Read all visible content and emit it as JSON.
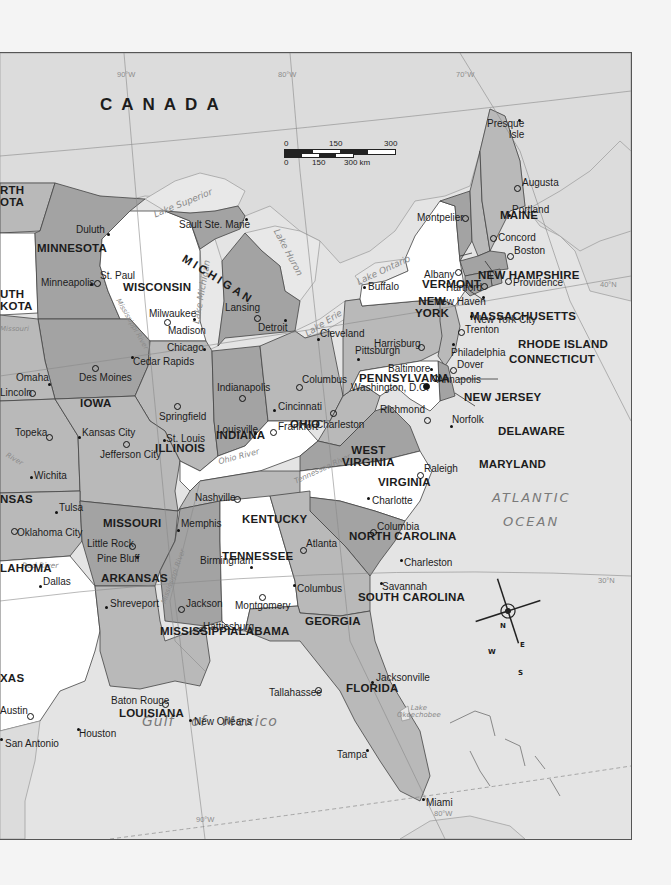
{
  "map": {
    "country_label": "CANADA",
    "oceans": {
      "atlantic_line1": "ATLANTIC",
      "atlantic_line2": "OCEAN",
      "gulf": "Gulf   of   Mexico"
    },
    "gridlines": {
      "w90_top": "90°W",
      "w80_top": "80°W",
      "w70_top": "70°W",
      "n40": "40°N",
      "n30": "30°N",
      "w90_bottom": "90°W",
      "w80_bottom": "80°W"
    },
    "scale_bar": {
      "mi_0": "0",
      "mi_150": "150",
      "mi_300": "300 mi",
      "km_0": "0",
      "km_150": "150",
      "km_300": "300 km"
    },
    "compass": {
      "n": "N",
      "s": "S",
      "e": "E",
      "w": "W"
    },
    "colors": {
      "dark_state": "#a3a3a3",
      "mid_state": "#b9b9b9",
      "light_state": "#ffffff",
      "foreign_land": "#dcdcdc",
      "water": "#e6e6e6",
      "border": "#3a3a3a"
    },
    "states": [
      {
        "id": "north-dakota",
        "label": "RTH\nOTA"
      },
      {
        "id": "minnesota",
        "label": "MINNESOTA"
      },
      {
        "id": "south-dakota",
        "label": "UTH\nKOTA"
      },
      {
        "id": "wisconsin",
        "label": "WISCONSIN"
      },
      {
        "id": "michigan",
        "label": "MICHIGAN"
      },
      {
        "id": "iowa",
        "label": "IOWA"
      },
      {
        "id": "illinois",
        "label": "ILLINOIS"
      },
      {
        "id": "indiana",
        "label": "INDIANA"
      },
      {
        "id": "ohio",
        "label": "OHIO"
      },
      {
        "id": "kansas",
        "label": "NSAS"
      },
      {
        "id": "missouri",
        "label": "MISSOURI"
      },
      {
        "id": "kentucky",
        "label": "KENTUCKY"
      },
      {
        "id": "west-virginia",
        "label": "WEST\nVIRGINIA"
      },
      {
        "id": "virginia",
        "label": "VIRGINIA"
      },
      {
        "id": "pennsylvania",
        "label": "PENNSYLVANIA"
      },
      {
        "id": "new-york",
        "label": "NEW\nYORK"
      },
      {
        "id": "vermont",
        "label": "VERMONT"
      },
      {
        "id": "new-hampshire",
        "label": "NEW HAMPSHIRE"
      },
      {
        "id": "maine",
        "label": "MAINE"
      },
      {
        "id": "massachusetts",
        "label": "MASSACHUSETTS"
      },
      {
        "id": "rhode-island",
        "label": "RHODE ISLAND"
      },
      {
        "id": "connecticut",
        "label": "CONNECTICUT"
      },
      {
        "id": "new-jersey",
        "label": "NEW JERSEY"
      },
      {
        "id": "delaware",
        "label": "DELAWARE"
      },
      {
        "id": "maryland",
        "label": "MARYLAND"
      },
      {
        "id": "oklahoma",
        "label": "LAHOMA"
      },
      {
        "id": "arkansas",
        "label": "ARKANSAS"
      },
      {
        "id": "tennessee",
        "label": "TENNESSEE"
      },
      {
        "id": "north-carolina",
        "label": "NORTH CAROLINA"
      },
      {
        "id": "south-carolina",
        "label": "SOUTH CAROLINA"
      },
      {
        "id": "mississippi",
        "label": "MISSISSIPPI"
      },
      {
        "id": "alabama",
        "label": "ALABAMA"
      },
      {
        "id": "georgia",
        "label": "GEORGIA"
      },
      {
        "id": "texas",
        "label": "XAS"
      },
      {
        "id": "louisiana",
        "label": "LOUISIANA"
      },
      {
        "id": "florida",
        "label": "FLORIDA"
      }
    ],
    "cities": [
      {
        "name": "Presque\nIsle"
      },
      {
        "name": "Augusta"
      },
      {
        "name": "Portland"
      },
      {
        "name": "Concord"
      },
      {
        "name": "Montpelier"
      },
      {
        "name": "Boston"
      },
      {
        "name": "Albany"
      },
      {
        "name": "Providence"
      },
      {
        "name": "Hartford"
      },
      {
        "name": "Buffalo"
      },
      {
        "name": "New Haven"
      },
      {
        "name": "New York City"
      },
      {
        "name": "Trenton"
      },
      {
        "name": "Harrisburg"
      },
      {
        "name": "Philadelphia"
      },
      {
        "name": "Pittsburgh"
      },
      {
        "name": "Dover"
      },
      {
        "name": "Baltimore"
      },
      {
        "name": "Annapolis"
      },
      {
        "name": "Washington, D.C."
      },
      {
        "name": "Richmond"
      },
      {
        "name": "Norfolk"
      },
      {
        "name": "Charleston"
      },
      {
        "name": "Cleveland"
      },
      {
        "name": "Columbus"
      },
      {
        "name": "Cincinnati"
      },
      {
        "name": "Frankfort"
      },
      {
        "name": "Louisville"
      },
      {
        "name": "Indianapolis"
      },
      {
        "name": "Springfield"
      },
      {
        "name": "St. Louis"
      },
      {
        "name": "Chicago"
      },
      {
        "name": "Detroit"
      },
      {
        "name": "Lansing"
      },
      {
        "name": "Milwaukee"
      },
      {
        "name": "Madison"
      },
      {
        "name": "Sault Ste. Marie"
      },
      {
        "name": "Duluth"
      },
      {
        "name": "Minneapolis"
      },
      {
        "name": "St. Paul"
      },
      {
        "name": "Cedar Rapids"
      },
      {
        "name": "Des Moines"
      },
      {
        "name": "Omaha"
      },
      {
        "name": "Lincoln"
      },
      {
        "name": "Topeka"
      },
      {
        "name": "Kansas City"
      },
      {
        "name": "Jefferson City"
      },
      {
        "name": "Wichita"
      },
      {
        "name": "Tulsa"
      },
      {
        "name": "Oklahoma City"
      },
      {
        "name": "Little Rock"
      },
      {
        "name": "Pine Bluff"
      },
      {
        "name": "Memphis"
      },
      {
        "name": "Nashville"
      },
      {
        "name": "Raleigh"
      },
      {
        "name": "Charlotte"
      },
      {
        "name": "Columbia"
      },
      {
        "name": "Charleston"
      },
      {
        "name": "Savannah"
      },
      {
        "name": "Atlanta"
      },
      {
        "name": "Columbus"
      },
      {
        "name": "Birmingham"
      },
      {
        "name": "Montgomery"
      },
      {
        "name": "Jackson"
      },
      {
        "name": "Hattiesburg"
      },
      {
        "name": "Shreveport"
      },
      {
        "name": "Dallas"
      },
      {
        "name": "Austin"
      },
      {
        "name": "San Antonio"
      },
      {
        "name": "Houston"
      },
      {
        "name": "Baton Rouge"
      },
      {
        "name": "New Orleans"
      },
      {
        "name": "Tallahassee"
      },
      {
        "name": "Jacksonville"
      },
      {
        "name": "Tampa"
      },
      {
        "name": "Miami"
      }
    ],
    "water_labels": {
      "lake_superior": "Lake Superior",
      "lake_michigan": "Lake Michigan",
      "lake_huron": "Lake Huron",
      "lake_erie": "Lake Erie",
      "lake_ontario": "Lake Ontario",
      "lake_okeechobee": "Lake\nOkeechobee",
      "mississippi_river": "Mississippi River",
      "missouri": "Missouri",
      "river_ks": "River",
      "ohio_river": "Ohio River",
      "tennessee_river": "Tennessee River",
      "red_river": "Red River",
      "mississippi_river_south": "Mississippi River"
    }
  }
}
